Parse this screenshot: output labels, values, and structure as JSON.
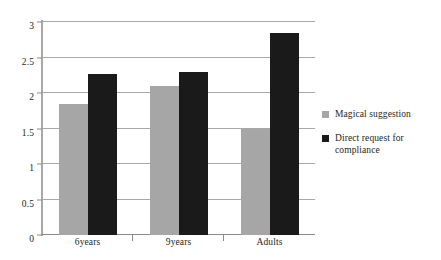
{
  "chart_data": {
    "type": "bar",
    "title": "",
    "xlabel": "",
    "ylabel": "",
    "categories": [
      "6years",
      "9years",
      "Adults"
    ],
    "series": [
      {
        "name": "Magical suggestion",
        "color": "#a6a6a6",
        "values": [
          1.85,
          2.1,
          1.5
        ]
      },
      {
        "name": "Direct request for compliance",
        "color": "#1a1a1a",
        "values": [
          2.27,
          2.3,
          2.85
        ]
      }
    ],
    "ylim": [
      0,
      3
    ],
    "yticks": [
      "0",
      "0.5",
      "1",
      "1.5",
      "2",
      "2.5",
      "3"
    ],
    "ytick_values": [
      0,
      0.5,
      1,
      1.5,
      2,
      2.5,
      3
    ],
    "grid": true,
    "legend_position": "right"
  }
}
